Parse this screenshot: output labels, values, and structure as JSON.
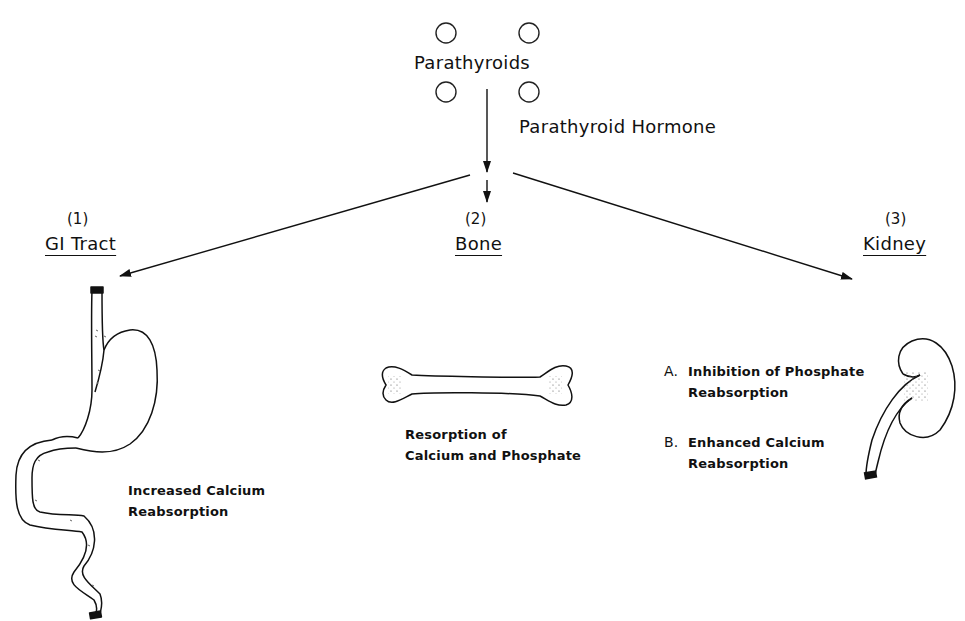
{
  "diagram": {
    "source": {
      "label": "Parathyroids",
      "gland_count": 4,
      "hormone_label": "Parathyroid Hormone"
    },
    "targets": [
      {
        "number": "(1)",
        "name": "GI Tract",
        "effects": [
          "Increased Calcium",
          "Reabsorption"
        ]
      },
      {
        "number": "(2)",
        "name": "Bone",
        "effects": [
          "Resorption  of",
          "Calcium  and Phosphate"
        ]
      },
      {
        "number": "(3)",
        "name": "Kidney",
        "effects": [
          {
            "marker": "A.",
            "lines": [
              "Inhibition of Phosphate",
              "Reabsorption"
            ]
          },
          {
            "marker": "B.",
            "lines": [
              "Enhanced Calcium",
              "Reabsorption"
            ]
          }
        ]
      }
    ],
    "colors": {
      "ink": "#111111",
      "background": "#ffffff"
    }
  }
}
